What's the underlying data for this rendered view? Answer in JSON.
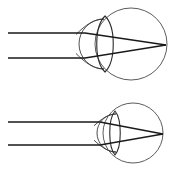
{
  "figure": {
    "title": "Eye accommodation ray diagram",
    "background_color": "#ffffff",
    "width": 175,
    "height": 177,
    "line_color": "#1a1a1a",
    "outline_color": "#4a4a4a",
    "panel_count": 2
  },
  "panels": [
    {
      "id": "panel-top",
      "name": "accommodated-eye",
      "label": "",
      "eyeball": {
        "center_x": 131,
        "center_y": 44,
        "radius": 36,
        "color": "#4a4a4a"
      },
      "cornea": {
        "center_x": 104,
        "center_y": 44,
        "radius": 25,
        "color": "#3a3a3a"
      },
      "lens": {
        "center_x": 105,
        "center_y": 44,
        "half_height": 28,
        "half_thickness": 11,
        "color": "#2a2a2a",
        "shape": "biconvex-thick"
      },
      "rays": [
        {
          "name": "upper-ray",
          "entry_y": 33,
          "start_x": 8,
          "bend_x": 85,
          "focus_x": 166,
          "focus_y": 45
        },
        {
          "name": "lower-ray",
          "entry_y": 58,
          "start_x": 8,
          "bend_x": 85,
          "focus_x": 166,
          "focus_y": 45
        }
      ],
      "focal_point": {
        "x": 166,
        "y": 45,
        "on_retina": true
      }
    },
    {
      "id": "panel-bottom",
      "name": "relaxed-eye",
      "label": "",
      "eyeball": {
        "center_x": 133,
        "center_y": 133,
        "radius": 30,
        "color": "#4a4a4a"
      },
      "cornea": {
        "center_x": 116,
        "center_y": 133,
        "radius": 19,
        "color": "#3a3a3a"
      },
      "lens": {
        "center_x": 115,
        "center_y": 133,
        "half_height": 22,
        "half_thickness": 7,
        "color": "#2a2a2a",
        "shape": "biconvex-thin"
      },
      "rays": [
        {
          "name": "upper-ray",
          "entry_y": 122,
          "start_x": 8,
          "bend_x": 100,
          "focus_x": 163,
          "focus_y": 134
        },
        {
          "name": "lower-ray",
          "entry_y": 145,
          "start_x": 8,
          "bend_x": 100,
          "focus_x": 163,
          "focus_y": 134
        }
      ],
      "focal_point": {
        "x": 163,
        "y": 134,
        "on_retina": true
      }
    }
  ]
}
